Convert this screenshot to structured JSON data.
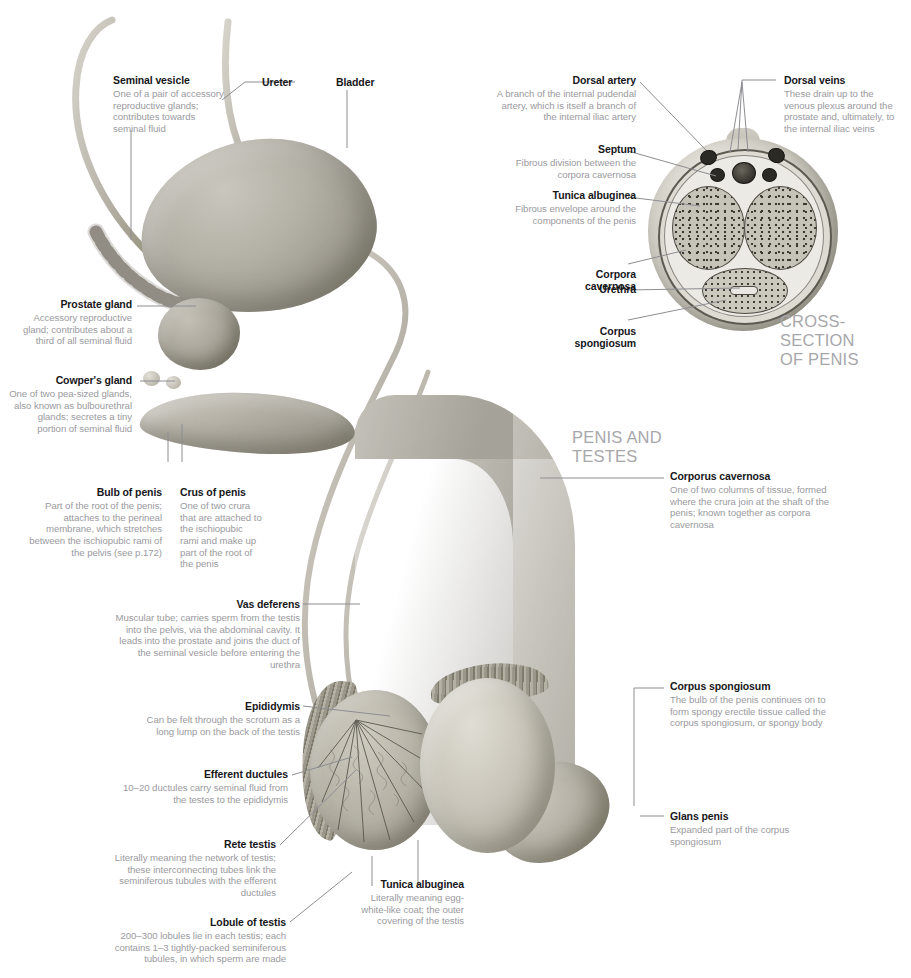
{
  "figure": {
    "headings": [
      {
        "id": "cross-section",
        "text": "CROSS-SECTION\nOF PENIS"
      },
      {
        "id": "penis-and-testes",
        "text": "PENIS AND\nTESTES"
      }
    ]
  },
  "labels": {
    "seminal_vesicle": {
      "title": "Seminal vesicle",
      "body": "One of a pair of accessory reproductive glands; contributes towards seminal fluid"
    },
    "ureter": {
      "title": "Ureter",
      "body": ""
    },
    "bladder": {
      "title": "Bladder",
      "body": ""
    },
    "prostate_gland": {
      "title": "Prostate gland",
      "body": "Accessory reproductive gland; contributes about a third of all seminal fluid"
    },
    "cowpers_gland": {
      "title": "Cowper's gland",
      "body": "One of two pea-sized glands, also known as bulbourethral glands; secretes a tiny portion of seminal fluid"
    },
    "bulb_of_penis": {
      "title": "Bulb of penis",
      "body": "Part of the root of the penis; attaches to the perineal membrane, which stretches between the ischiopubic rami of the pelvis (see p.172)"
    },
    "crus_of_penis": {
      "title": "Crus of penis",
      "body": "One of two crura that are attached to the ischiopubic rami and make up part of the root of the penis"
    },
    "vas_deferens": {
      "title": "Vas deferens",
      "body": "Muscular tube; carries sperm from the testis into the pelvis, via the abdominal cavity. It leads into the prostate and joins the duct of the seminal vesicle before entering the urethra"
    },
    "epididymis": {
      "title": "Epididymis",
      "body": "Can be felt through the scrotum as a long lump on the back of the testis"
    },
    "efferent_ductules": {
      "title": "Efferent ductules",
      "body": "10–20 ductules carry seminal fluid from the testes to the epididymis"
    },
    "rete_testis": {
      "title": "Rete testis",
      "body": "Literally meaning the network of testis; these interconnecting tubes link the seminiferous tubules with the efferent ductules"
    },
    "lobule_of_testis": {
      "title": "Lobule of testis",
      "body": "200–300 lobules lie in each testis; each contains 1–3 tightly-packed seminiferous tubules, in which sperm are made"
    },
    "tunica_albuginea_testis": {
      "title": "Tunica albuginea",
      "body": "Literally meaning egg-white-like coat; the outer covering of the testis"
    },
    "dorsal_artery": {
      "title": "Dorsal artery",
      "body": "A branch of the internal pudendal artery, which is itself a branch of the internal iliac artery"
    },
    "dorsal_veins": {
      "title": "Dorsal veins",
      "body": "These drain up to the venous plexus around the prostate and, ultimately, to the internal iliac veins"
    },
    "septum": {
      "title": "Septum",
      "body": "Fibrous division between the corpora cavernosa"
    },
    "tunica_albuginea_penis": {
      "title": "Tunica albuginea",
      "body": "Fibrous envelope around the components of the penis"
    },
    "corpora_cavernosa_xsec": {
      "title": "Corpora\ncavernosa",
      "body": ""
    },
    "urethra_xsec": {
      "title": "Urethra",
      "body": ""
    },
    "corpus_spongiosum_xsec": {
      "title": "Corpus\nspongiosum",
      "body": ""
    },
    "corporus_cavernosa": {
      "title": "Corporus cavernosa",
      "body": "One of two columns of tissue, formed where the crura join at the shaft of the penis; known together as corpora cavernosa"
    },
    "corpus_spongiosum": {
      "title": "Corpus spongiosum",
      "body": "The bulb of the penis continues on to form spongy erectile tissue called the corpus spongiosum, or spongy body"
    },
    "glans_penis": {
      "title": "Glans penis",
      "body": "Expanded part of the corpus spongiosum"
    }
  },
  "colors": {
    "title_text": "#17171a",
    "body_text": "#9a9a9e",
    "heading_text": "#a7a7ab",
    "leader_line": "#8e8e93",
    "page_background": "#ffffff"
  }
}
